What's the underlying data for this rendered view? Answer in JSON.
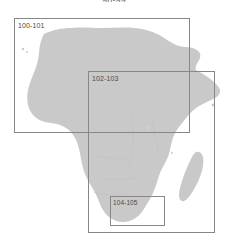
{
  "caption": {
    "text": "98-99"
  },
  "map": {
    "region_name": "Africa",
    "land_color": "#c9c9c9",
    "water_color": "#ffffff",
    "border_color": "#878787",
    "label_color": "#4a4a4a",
    "islands": [
      "Madagascar",
      "Comoros",
      "Socotra",
      "Canary Islands"
    ]
  },
  "index_boxes": [
    {
      "id": "box-100-101",
      "label": "100-101",
      "page_range": "100-101",
      "coverage": "North and West Africa"
    },
    {
      "id": "box-102-103",
      "label": "102-103",
      "page_range": "102-103",
      "coverage": "Central, East and Southern Africa"
    },
    {
      "id": "box-104-105",
      "label": "104-105",
      "page_range": "104-105",
      "coverage": "South Africa"
    }
  ]
}
